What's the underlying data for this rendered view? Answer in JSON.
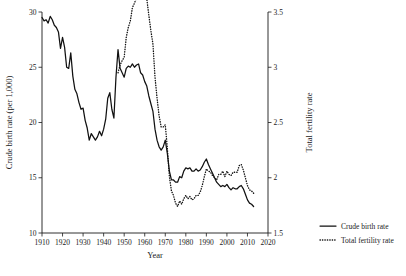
{
  "chart_data": {
    "type": "line",
    "title": "",
    "xlabel": "Year",
    "ylabel": "Crude birth rate (per 1,000)",
    "y2label": "Total fertility rate",
    "xlim": [
      1910,
      2020
    ],
    "ylim": [
      10,
      30
    ],
    "y2lim": [
      1.5,
      3.5
    ],
    "grid": false,
    "legend_position": "right-bottom",
    "xticks": [
      1910,
      1920,
      1930,
      1940,
      1950,
      1960,
      1970,
      1980,
      1990,
      2000,
      2010,
      2020
    ],
    "xtick_labels": [
      "1910",
      "1920",
      "1930",
      "1940",
      "1950",
      "1960",
      "1970",
      "1980",
      "1990",
      "2000",
      "2010",
      "2020"
    ],
    "yticks": [
      10,
      15,
      20,
      25,
      30
    ],
    "ytick_labels": [
      "10",
      "15",
      "20",
      "25",
      "30"
    ],
    "y2ticks": [
      1.5,
      2,
      2.5,
      3,
      3.5
    ],
    "y2tick_labels": [
      "1.5",
      "2",
      "2.5",
      "3",
      "3.5"
    ],
    "series": [
      {
        "name": "Crude birth rate",
        "axis": "left",
        "style": "solid",
        "color": "#111111",
        "x": [
          1910,
          1911,
          1912,
          1913,
          1914,
          1915,
          1916,
          1917,
          1918,
          1919,
          1920,
          1921,
          1922,
          1923,
          1924,
          1925,
          1926,
          1927,
          1928,
          1929,
          1930,
          1931,
          1932,
          1933,
          1934,
          1935,
          1936,
          1937,
          1938,
          1939,
          1940,
          1941,
          1942,
          1943,
          1944,
          1945,
          1946,
          1947,
          1948,
          1949,
          1950,
          1951,
          1952,
          1953,
          1954,
          1955,
          1956,
          1957,
          1958,
          1959,
          1960,
          1961,
          1962,
          1963,
          1964,
          1965,
          1966,
          1967,
          1968,
          1969,
          1970,
          1971,
          1972,
          1973,
          1974,
          1975,
          1976,
          1977,
          1978,
          1979,
          1980,
          1981,
          1982,
          1983,
          1984,
          1985,
          1986,
          1987,
          1988,
          1989,
          1990,
          1991,
          1992,
          1993,
          1994,
          1995,
          1996,
          1997,
          1998,
          1999,
          2000,
          2001,
          2002,
          2003,
          2004,
          2005,
          2006,
          2007,
          2008,
          2009,
          2010,
          2011,
          2012,
          2013
        ],
        "values": [
          29.5,
          29.2,
          29.3,
          29.0,
          29.6,
          29.3,
          28.8,
          28.6,
          28.2,
          26.7,
          27.7,
          26.8,
          25.0,
          24.9,
          26.3,
          24.2,
          23.0,
          22.6,
          21.8,
          21.2,
          21.3,
          20.2,
          19.5,
          18.4,
          19.0,
          18.7,
          18.4,
          18.7,
          19.2,
          18.8,
          19.4,
          20.3,
          22.2,
          22.7,
          21.2,
          20.4,
          24.1,
          26.6,
          24.9,
          24.5,
          24.1,
          24.9,
          25.1,
          25.0,
          25.3,
          25.0,
          25.2,
          25.3,
          24.5,
          24.3,
          23.7,
          23.3,
          22.4,
          21.7,
          21.0,
          19.4,
          18.4,
          17.8,
          17.5,
          17.8,
          18.4,
          17.2,
          15.6,
          14.8,
          14.8,
          14.6,
          14.6,
          15.1,
          15.0,
          15.6,
          15.9,
          15.8,
          15.9,
          15.6,
          15.6,
          15.8,
          15.6,
          15.7,
          16.0,
          16.4,
          16.7,
          16.2,
          15.8,
          15.4,
          15.0,
          14.6,
          14.4,
          14.2,
          14.3,
          14.2,
          14.4,
          14.1,
          13.9,
          14.1,
          14.0,
          14.0,
          14.2,
          14.3,
          14.0,
          13.5,
          13.0,
          12.7,
          12.6,
          12.4
        ]
      },
      {
        "name": "Total fertility rate",
        "axis": "right",
        "style": "dotted",
        "color": "#111111",
        "x": [
          1947,
          1948,
          1949,
          1950,
          1951,
          1952,
          1953,
          1954,
          1955,
          1956,
          1957,
          1958,
          1959,
          1960,
          1961,
          1962,
          1963,
          1964,
          1965,
          1966,
          1967,
          1968,
          1969,
          1970,
          1971,
          1972,
          1973,
          1974,
          1975,
          1976,
          1977,
          1978,
          1979,
          1980,
          1981,
          1982,
          1983,
          1984,
          1985,
          1986,
          1987,
          1988,
          1989,
          1990,
          1991,
          1992,
          1993,
          1994,
          1995,
          1996,
          1997,
          1998,
          1999,
          2000,
          2001,
          2002,
          2003,
          2004,
          2005,
          2006,
          2007,
          2008,
          2009,
          2010,
          2011,
          2012,
          2013
        ],
        "values": [
          2.95,
          3.02,
          3.06,
          3.09,
          3.27,
          3.36,
          3.42,
          3.54,
          3.58,
          3.63,
          3.68,
          3.63,
          3.67,
          3.65,
          3.62,
          3.47,
          3.33,
          3.21,
          2.91,
          2.72,
          2.56,
          2.46,
          2.46,
          2.48,
          2.27,
          2.01,
          1.88,
          1.84,
          1.77,
          1.74,
          1.79,
          1.76,
          1.81,
          1.84,
          1.81,
          1.83,
          1.8,
          1.81,
          1.84,
          1.84,
          1.87,
          1.93,
          2.01,
          2.08,
          2.06,
          2.05,
          2.02,
          2.0,
          1.98,
          2.03,
          2.03,
          2.06,
          2.01,
          2.06,
          2.03,
          2.02,
          2.05,
          2.05,
          2.05,
          2.11,
          2.12,
          2.07,
          2.0,
          1.93,
          1.89,
          1.88,
          1.86
        ]
      }
    ],
    "legend": [
      {
        "label": "Crude birth rate",
        "style": "solid"
      },
      {
        "label": "Total fertility rate",
        "style": "dotted"
      }
    ]
  }
}
